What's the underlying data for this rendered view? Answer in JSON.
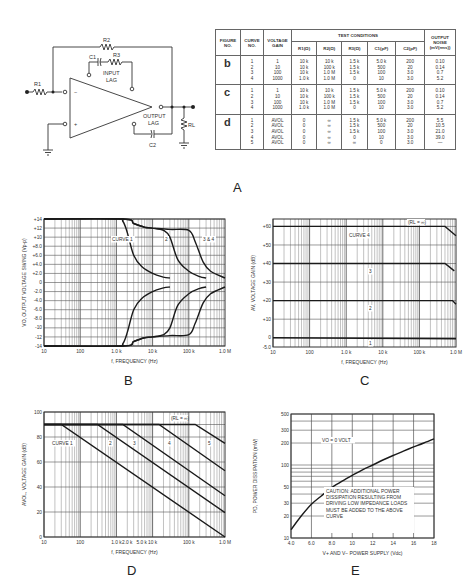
{
  "panels": {
    "a_label": "A",
    "b_label": "B",
    "c_label": "C",
    "d_label": "D",
    "e_label": "E"
  },
  "schematic": {
    "labels": {
      "r1": "R1",
      "r2": "R2",
      "r3": "R3",
      "c1": "C1",
      "c2": "C2",
      "rl": "RL",
      "input_lag_1": "INPUT",
      "input_lag_2": "LAG",
      "output_lag_1": "OUTPUT",
      "output_lag_2": "LAG",
      "minus": "−",
      "plus": "+"
    }
  },
  "table": {
    "headers": {
      "figure_no": "FIGURE NO.",
      "curve_no": "CURVE NO.",
      "voltage_gain": "VOLTAGE GAIN",
      "test_conditions": "TEST CONDITIONS",
      "r1": "R1(Ω)",
      "r2": "R2(Ω)",
      "r3": "R3(Ω)",
      "c1": "C1(pF)",
      "c2": "C2(pF)",
      "output_noise": "OUTPUT NOISE (mV(rms))"
    },
    "groups": [
      {
        "figure": "b",
        "rows": [
          {
            "curve": "1",
            "gain": "1",
            "r1": "10 k",
            "r2": "10 k",
            "r3": "1.5 k",
            "c1": "5.0 k",
            "c2": "200",
            "noise": "0.10"
          },
          {
            "curve": "2",
            "gain": "10",
            "r1": "10 k",
            "r2": "100 k",
            "r3": "1.5 k",
            "c1": "500",
            "c2": "20",
            "noise": "0.14"
          },
          {
            "curve": "3",
            "gain": "100",
            "r1": "10 k",
            "r2": "1.0 M",
            "r3": "1.5 k",
            "c1": "100",
            "c2": "3.0",
            "noise": "0.7"
          },
          {
            "curve": "4",
            "gain": "1000",
            "r1": "1.0 k",
            "r2": "1.0 M",
            "r3": "0",
            "c1": "10",
            "c2": "3.0",
            "noise": "5.2"
          }
        ]
      },
      {
        "figure": "c",
        "rows": [
          {
            "curve": "1",
            "gain": "1",
            "r1": "10 k",
            "r2": "10 k",
            "r3": "1.5 k",
            "c1": "5.0 k",
            "c2": "200",
            "noise": "0.10"
          },
          {
            "curve": "2",
            "gain": "10",
            "r1": "10 k",
            "r2": "100 k",
            "r3": "1.5 k",
            "c1": "500",
            "c2": "20",
            "noise": "0.14"
          },
          {
            "curve": "3",
            "gain": "100",
            "r1": "10 k",
            "r2": "1.0 M",
            "r3": "1.5 k",
            "c1": "100",
            "c2": "3.0",
            "noise": "0.7"
          },
          {
            "curve": "4",
            "gain": "1000",
            "r1": "1.0 k",
            "r2": "1.0 M",
            "r3": "0",
            "c1": "10",
            "c2": "3.0",
            "noise": "5.2"
          }
        ]
      },
      {
        "figure": "d",
        "rows": [
          {
            "curve": "1",
            "gain": "AVOL",
            "r1": "0",
            "r2": "∞",
            "r3": "1.5 k",
            "c1": "5.0 k",
            "c2": "200",
            "noise": "5.5"
          },
          {
            "curve": "2",
            "gain": "AVOL",
            "r1": "0",
            "r2": "∞",
            "r3": "1.5 k",
            "c1": "500",
            "c2": "20",
            "noise": "10.5"
          },
          {
            "curve": "3",
            "gain": "AVOL",
            "r1": "0",
            "r2": "∞",
            "r3": "1.5 k",
            "c1": "100",
            "c2": "3.0",
            "noise": "21.0"
          },
          {
            "curve": "4",
            "gain": "AVOL",
            "r1": "0",
            "r2": "∞",
            "r3": "0",
            "c1": "10",
            "c2": "3.0",
            "noise": "39.0"
          },
          {
            "curve": "5",
            "gain": "AVOL",
            "r1": "0",
            "r2": "∞",
            "r3": "∞",
            "c1": "0",
            "c2": "3.0",
            "noise": "—"
          }
        ]
      }
    ]
  },
  "chart_data": [
    {
      "id": "B",
      "type": "line",
      "title": "",
      "xlabel": "f, FREQUENCY (Hz)",
      "ylabel": "VO, OUTPUT VOLTAGE SWING (Vp-p)",
      "xscale": "log",
      "xlim": [
        10,
        1000000
      ],
      "ylim": [
        -14,
        14
      ],
      "xticks": [
        "10",
        "100",
        "1.0 k",
        "10 k",
        "100 k",
        "1.0 M"
      ],
      "yticks": [
        "+14",
        "+12",
        "+10",
        "+8.0",
        "+6.0",
        "+4.0",
        "+2.0",
        "0",
        "-2.0",
        "-4.0",
        "-6.0",
        "-8.0",
        "-10",
        "-12",
        "-14"
      ],
      "grid": true,
      "annotations": [
        "CURVE 1",
        "2",
        "3 & 4"
      ],
      "series": [
        {
          "name": "Curve 1 (+)",
          "x": [
            10,
            1000,
            1500,
            2000,
            3000,
            5000,
            10000,
            20000,
            30000
          ],
          "y": [
            14,
            14,
            13.5,
            11,
            6,
            3.5,
            2,
            1.2,
            1
          ]
        },
        {
          "name": "Curve 1 (−)",
          "x": [
            10,
            1000,
            1500,
            2000,
            3000,
            5000,
            10000,
            20000,
            30000
          ],
          "y": [
            -14,
            -14,
            -13.5,
            -11,
            -6,
            -3.5,
            -2,
            -1.2,
            -1
          ]
        },
        {
          "name": "Curve 2 (+)",
          "x": [
            10,
            1500,
            3000,
            6000,
            10000,
            20000,
            30000,
            50000,
            100000,
            200000,
            300000
          ],
          "y": [
            14,
            14,
            13,
            12.2,
            12,
            11.5,
            10,
            5,
            2.5,
            1.3,
            1
          ]
        },
        {
          "name": "Curve 2 (−)",
          "x": [
            10,
            1500,
            3000,
            6000,
            10000,
            20000,
            30000,
            50000,
            100000,
            200000,
            300000
          ],
          "y": [
            -14,
            -14,
            -13,
            -12.2,
            -12,
            -11.5,
            -10,
            -5,
            -2.5,
            -1.3,
            -1
          ]
        },
        {
          "name": "Curve 3 & 4 (+)",
          "x": [
            10,
            1500,
            3000,
            6000,
            10000,
            30000,
            100000,
            150000,
            250000,
            400000,
            1000000
          ],
          "y": [
            14,
            14,
            13,
            12.2,
            12,
            11.7,
            11.5,
            9,
            4.5,
            2.5,
            1
          ]
        },
        {
          "name": "Curve 3 & 4 (−)",
          "x": [
            10,
            1500,
            3000,
            6000,
            10000,
            30000,
            100000,
            150000,
            250000,
            400000,
            1000000
          ],
          "y": [
            -14,
            -14,
            -13,
            -12.2,
            -12,
            -11.7,
            -11.5,
            -9,
            -4.5,
            -2.5,
            -1
          ]
        }
      ]
    },
    {
      "id": "C",
      "type": "line",
      "title": "",
      "xlabel": "f, FREQUENCY (Hz)",
      "ylabel": "AV, VOLTAGE GAIN (dB)",
      "xscale": "log",
      "xlim": [
        10,
        1000000
      ],
      "ylim": [
        -5,
        64
      ],
      "xticks": [
        "10",
        "100",
        "1.0 k",
        "10 k",
        "100 k",
        "1.0 M"
      ],
      "yticks": [
        "+60",
        "+50",
        "+40",
        "+30",
        "+20",
        "+10",
        "0",
        "-5.0"
      ],
      "grid": true,
      "annotations": [
        "CURVE 4",
        "3",
        "2",
        "1",
        "(RL = ∞)"
      ],
      "series": [
        {
          "name": "Curve 1",
          "x": [
            10,
            1000000
          ],
          "y": [
            0,
            -0.5
          ]
        },
        {
          "name": "Curve 2",
          "x": [
            10,
            800000,
            1000000
          ],
          "y": [
            20,
            20,
            18
          ]
        },
        {
          "name": "Curve 3",
          "x": [
            10,
            500000,
            900000
          ],
          "y": [
            40,
            40,
            36
          ]
        },
        {
          "name": "Curve 4",
          "x": [
            10,
            500000,
            1000000
          ],
          "y": [
            60,
            60,
            55
          ]
        }
      ]
    },
    {
      "id": "D",
      "type": "line",
      "title": "",
      "xlabel": "f, FREQUENCY (Hz)",
      "ylabel": "AVOL, VOLTAGE GAIN (dB)",
      "xscale": "log",
      "xlim": [
        10,
        1000000
      ],
      "ylim": [
        0,
        100
      ],
      "xticks": [
        "10",
        "100",
        "1.0 k",
        "2.0 k",
        "5.0 k",
        "10 k",
        "100 k",
        "1.0 M"
      ],
      "yticks": [
        "100",
        "80",
        "60",
        "40",
        "20",
        "0"
      ],
      "grid": true,
      "annotations": [
        "CURVE 1",
        "2",
        "3",
        "4",
        "5",
        "(RL = ∞)"
      ],
      "series": [
        {
          "name": "Curve 1",
          "x": [
            10,
            30,
            1000000
          ],
          "y": [
            90,
            90,
            0
          ]
        },
        {
          "name": "Curve 2",
          "x": [
            10,
            300,
            1000000
          ],
          "y": [
            90,
            90,
            19.5
          ]
        },
        {
          "name": "Curve 3",
          "x": [
            10,
            1500,
            1000000
          ],
          "y": [
            90,
            90,
            33
          ]
        },
        {
          "name": "Curve 4",
          "x": [
            10,
            15000,
            1000000
          ],
          "y": [
            90,
            90,
            53
          ]
        },
        {
          "name": "Curve 5",
          "x": [
            10,
            150000,
            1000000
          ],
          "y": [
            90,
            90,
            75
          ]
        }
      ]
    },
    {
      "id": "E",
      "type": "line",
      "title": "",
      "xlabel": "V+ AND V− POWER SUPPLY (Vdc)",
      "ylabel": "PD, POWER DISSIPATION (mW)",
      "xscale": "linear",
      "yscale": "log",
      "xlim": [
        4,
        18
      ],
      "ylim": [
        10,
        500
      ],
      "xticks": [
        "4.0",
        "6.0",
        "8.0",
        "10",
        "12",
        "14",
        "16",
        "18"
      ],
      "yticks": [
        "500",
        "300",
        "200",
        "100",
        "50",
        "30",
        "20",
        "10"
      ],
      "grid": true,
      "annotations": [
        "VO = 0 VOLT",
        "CAUTION: ADDITIONAL POWER DISSIPATION RESULTING FROM DRIVING LOW IMPEDANCE LOADS MUST BE ADDED TO THE ABOVE CURVE"
      ],
      "series": [
        {
          "name": "PD",
          "x": [
            4,
            5,
            6,
            7,
            8,
            9,
            10,
            11,
            12,
            13,
            14,
            15,
            16,
            17,
            18
          ],
          "y": [
            13,
            20,
            29,
            38,
            49,
            60,
            72,
            86,
            100,
            117,
            135,
            155,
            177,
            200,
            228
          ]
        }
      ]
    }
  ],
  "chart_text": {
    "B": {
      "curve1": "CURVE 1",
      "curve2": "2",
      "curve34": "3 & 4"
    },
    "C": {
      "curve4": "CURVE 4",
      "curve3": "3",
      "curve2": "2",
      "curve1": "1",
      "rl": "(RL = ∞)"
    },
    "D": {
      "curve1": "CURVE 1",
      "curve2": "2",
      "curve3": "3",
      "curve4": "4",
      "curve5": "5",
      "rl": "(RL = ∞)"
    },
    "E": {
      "vo": "VO = 0 VOLT",
      "caution": [
        "CAUTION: ADDITIONAL POWER",
        "DISSIPATION RESULTING FROM",
        "DRIVING LOW IMPEDANCE LOADS",
        "MUST BE ADDED TO THE ABOVE",
        "CURVE"
      ]
    }
  }
}
